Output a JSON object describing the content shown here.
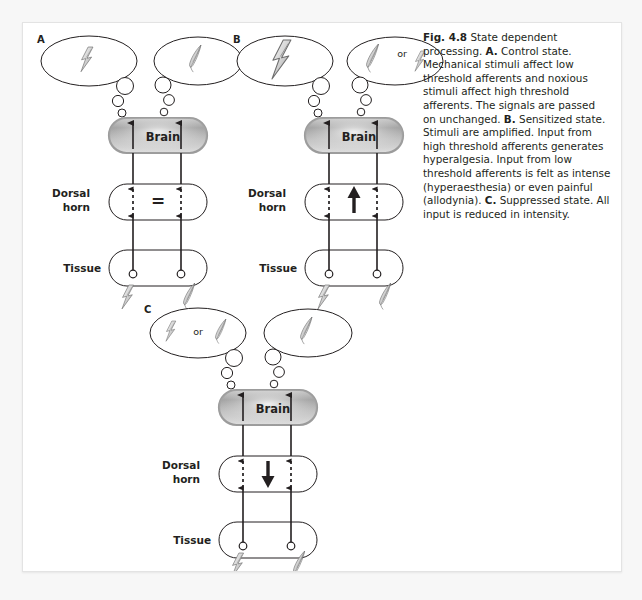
{
  "figure": {
    "number": "Fig. 4.8",
    "caption_title": "State dependent processing.",
    "caption_runs": [
      {
        "t": "Fig. 4.8",
        "b": true
      },
      {
        "t": " State dependent processing. ",
        "b": false
      },
      {
        "t": "A.",
        "b": true
      },
      {
        "t": " Control state. Mechanical stimuli affect low threshold afferents and noxious stimuli affect high threshold afferents. The signals are passed on unchanged. ",
        "b": false
      },
      {
        "t": "B.",
        "b": true
      },
      {
        "t": " Sensitized state. Stimuli are amplified. Input from high threshold afferents generates hyperalgesia. Input from low threshold afferents is felt as intense (hyperaesthesia) or even painful (allodynia). ",
        "b": false
      },
      {
        "t": "C.",
        "b": true
      },
      {
        "t": " Suppressed state. All input is reduced in intensity.",
        "b": false
      }
    ],
    "caption_plain": "Fig. 4.8 State dependent processing. A. Control state. Mechanical stimuli affect low threshold afferents and noxious stimuli affect high threshold afferents. The signals are passed on unchanged. B. Sensitized state. Stimuli are amplified. Input from high threshold afferents generates hyperalgesia. Input from low threshold afferents is felt as intense (hyperaesthesia) or even painful (allodynia). C. Suppressed state. All input is reduced in intensity."
  },
  "labels": {
    "brain": "Brain",
    "dorsal_horn_line1": "Dorsal",
    "dorsal_horn_line2": "horn",
    "tissue": "Tissue",
    "or": "or"
  },
  "colors": {
    "stroke": "#231f20",
    "page_bg": "#ffffff",
    "outer_bg": "#f7f7f7",
    "brain_fill_light": "#f2f2f2",
    "brain_fill_dark": "#8e8e8e",
    "icon_fill_light": "#e8e8e8",
    "icon_fill_mid": "#b5b5b5",
    "text": "#231f20"
  },
  "panels": [
    {
      "id": "A",
      "letter": "A",
      "title": "Control state",
      "left_bubble": {
        "icons": [
          "bolt"
        ],
        "bolt_scale": "small",
        "has_or": false
      },
      "right_bubble": {
        "icons": [
          "feather"
        ],
        "has_or": false
      },
      "dorsal_sign": "equals",
      "dorsal_sign_glyph": "=",
      "tissue_stimuli": [
        "bolt",
        "feather"
      ]
    },
    {
      "id": "B",
      "letter": "B",
      "title": "Sensitized state",
      "left_bubble": {
        "icons": [
          "bolt"
        ],
        "bolt_scale": "large",
        "has_or": false
      },
      "right_bubble": {
        "icons": [
          "feather",
          "bolt"
        ],
        "has_or": true
      },
      "dorsal_sign": "arrow-up",
      "dorsal_sign_glyph": "↑",
      "tissue_stimuli": [
        "bolt",
        "feather"
      ]
    },
    {
      "id": "C",
      "letter": "C",
      "title": "Suppressed state",
      "left_bubble": {
        "icons": [
          "bolt",
          "feather"
        ],
        "bolt_scale": "small",
        "has_or": true
      },
      "right_bubble": {
        "icons": [
          "feather"
        ],
        "has_or": false
      },
      "dorsal_sign": "arrow-down",
      "dorsal_sign_glyph": "↓",
      "tissue_stimuli": [
        "bolt",
        "feather"
      ]
    }
  ]
}
